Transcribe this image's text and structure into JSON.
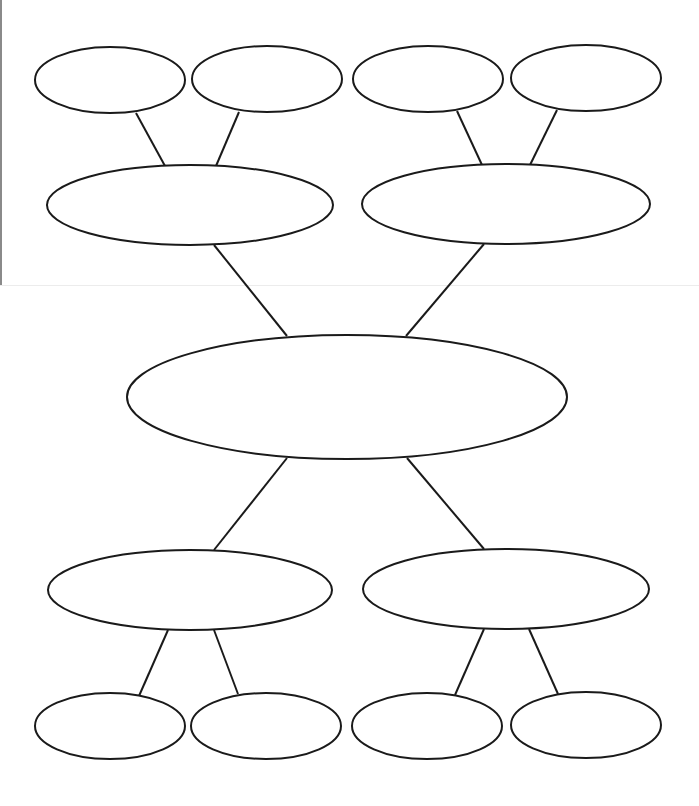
{
  "diagram": {
    "type": "double-bubble-map",
    "title": "",
    "stroke_color": "#1a1a1a",
    "fill_color": "#ffffff",
    "nodes": [
      {
        "id": "center",
        "label": "",
        "cx": 347,
        "cy": 397,
        "rx": 220,
        "ry": 62
      },
      {
        "id": "mid-top-left",
        "label": "",
        "cx": 190,
        "cy": 205,
        "rx": 143,
        "ry": 40
      },
      {
        "id": "mid-top-right",
        "label": "",
        "cx": 506,
        "cy": 204,
        "rx": 144,
        "ry": 40
      },
      {
        "id": "mid-bottom-left",
        "label": "",
        "cx": 190,
        "cy": 590,
        "rx": 142,
        "ry": 40
      },
      {
        "id": "mid-bottom-right",
        "label": "",
        "cx": 506,
        "cy": 589,
        "rx": 143,
        "ry": 40
      },
      {
        "id": "leaf-top-1",
        "label": "",
        "cx": 110,
        "cy": 80,
        "rx": 75,
        "ry": 33
      },
      {
        "id": "leaf-top-2",
        "label": "",
        "cx": 267,
        "cy": 79,
        "rx": 75,
        "ry": 33
      },
      {
        "id": "leaf-top-3",
        "label": "",
        "cx": 428,
        "cy": 79,
        "rx": 75,
        "ry": 33
      },
      {
        "id": "leaf-top-4",
        "label": "",
        "cx": 586,
        "cy": 78,
        "rx": 75,
        "ry": 33
      },
      {
        "id": "leaf-bottom-1",
        "label": "",
        "cx": 110,
        "cy": 726,
        "rx": 75,
        "ry": 33
      },
      {
        "id": "leaf-bottom-2",
        "label": "",
        "cx": 266,
        "cy": 726,
        "rx": 75,
        "ry": 33
      },
      {
        "id": "leaf-bottom-3",
        "label": "",
        "cx": 427,
        "cy": 726,
        "rx": 75,
        "ry": 33
      },
      {
        "id": "leaf-bottom-4",
        "label": "",
        "cx": 586,
        "cy": 725,
        "rx": 75,
        "ry": 33
      }
    ],
    "edges": [
      {
        "from": "leaf-top-1",
        "to": "mid-top-left",
        "x1": 136,
        "y1": 113,
        "x2": 165,
        "y2": 166
      },
      {
        "from": "leaf-top-2",
        "to": "mid-top-left",
        "x1": 239,
        "y1": 112,
        "x2": 216,
        "y2": 166
      },
      {
        "from": "leaf-top-3",
        "to": "mid-top-right",
        "x1": 457,
        "y1": 111,
        "x2": 482,
        "y2": 165
      },
      {
        "from": "leaf-top-4",
        "to": "mid-top-right",
        "x1": 557,
        "y1": 110,
        "x2": 530,
        "y2": 165
      },
      {
        "from": "mid-top-left",
        "to": "center",
        "x1": 214,
        "y1": 245,
        "x2": 287,
        "y2": 336
      },
      {
        "from": "mid-top-right",
        "to": "center",
        "x1": 484,
        "y1": 244,
        "x2": 406,
        "y2": 336
      },
      {
        "from": "center",
        "to": "mid-bottom-left",
        "x1": 287,
        "y1": 458,
        "x2": 214,
        "y2": 550
      },
      {
        "from": "center",
        "to": "mid-bottom-right",
        "x1": 407,
        "y1": 458,
        "x2": 484,
        "y2": 549
      },
      {
        "from": "mid-bottom-left",
        "to": "leaf-bottom-1",
        "x1": 168,
        "y1": 630,
        "x2": 139,
        "y2": 696
      },
      {
        "from": "mid-bottom-left",
        "to": "leaf-bottom-2",
        "x1": 214,
        "y1": 630,
        "x2": 238,
        "y2": 694
      },
      {
        "from": "mid-bottom-right",
        "to": "leaf-bottom-3",
        "x1": 484,
        "y1": 629,
        "x2": 455,
        "y2": 695
      },
      {
        "from": "mid-bottom-right",
        "to": "leaf-bottom-4",
        "x1": 529,
        "y1": 629,
        "x2": 558,
        "y2": 694
      }
    ]
  }
}
